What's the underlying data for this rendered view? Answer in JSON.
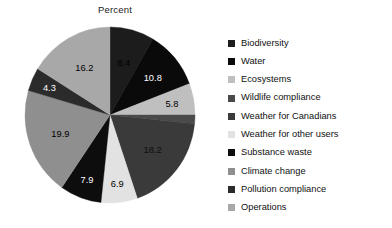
{
  "chart_data": {
    "type": "pie",
    "title": "Percent",
    "xlabel": "",
    "ylabel": "",
    "legend_position": "right",
    "grid": false,
    "start_angle_deg": 0,
    "direction": "clockwise",
    "categories": [
      "Biodiversity",
      "Water",
      "Ecosystems",
      "Wildlife compliance",
      "Weather for Canadians",
      "Weather for other users",
      "Substance waste",
      "Climate change",
      "Pollution compliance",
      "Operations"
    ],
    "values": [
      8.4,
      10.8,
      5.8,
      1.6,
      18.2,
      6.9,
      7.9,
      19.9,
      4.3,
      16.2
    ],
    "labels": [
      "8.4",
      "10.8",
      "5.8",
      "1.6",
      "18.2",
      "6.9",
      "7.9",
      "19.9",
      "4.3",
      "16.2"
    ],
    "colors": [
      "#1c1c1c",
      "#0a0a0a",
      "#bfbfbf",
      "#4a4a4a",
      "#3a3a3a",
      "#e2e2e2",
      "#0d0d0d",
      "#8f8f8f",
      "#2b2b2b",
      "#a8a8a8"
    ],
    "label_colors": [
      "#000000",
      "#ffffff",
      "#000000",
      "#000000",
      "#0e0e0e",
      "#000000",
      "#ffffff",
      "#000000",
      "#ffffff",
      "#000000"
    ],
    "label_radius_frac": [
      0.62,
      0.66,
      0.74,
      1.14,
      0.64,
      0.78,
      0.78,
      0.62,
      0.78,
      0.62
    ]
  },
  "legend": {
    "items": [
      {
        "label": "Biodiversity",
        "color": "#1c1c1c"
      },
      {
        "label": "Water",
        "color": "#0a0a0a"
      },
      {
        "label": "Ecosystems",
        "color": "#bfbfbf"
      },
      {
        "label": "Wildlife compliance",
        "color": "#4a4a4a"
      },
      {
        "label": "Weather for Canadians",
        "color": "#3a3a3a"
      },
      {
        "label": "Weather for other users",
        "color": "#e2e2e2"
      },
      {
        "label": "Substance waste",
        "color": "#0d0d0d"
      },
      {
        "label": "Climate change",
        "color": "#8f8f8f"
      },
      {
        "label": "Pollution compliance",
        "color": "#2b2b2b"
      },
      {
        "label": "Operations",
        "color": "#a8a8a8"
      }
    ]
  }
}
